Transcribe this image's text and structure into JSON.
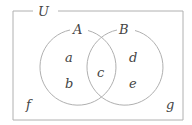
{
  "diagram": {
    "type": "venn",
    "universe_label": "U",
    "sets": [
      {
        "label": "A",
        "regions": [
          "a",
          "b",
          "c"
        ]
      },
      {
        "label": "B",
        "regions": [
          "c",
          "d",
          "e"
        ]
      }
    ],
    "regions": {
      "a": "a",
      "b": "b",
      "c": "c",
      "d": "d",
      "e": "e",
      "f": "f",
      "g": "g"
    },
    "colors": {
      "stroke": "#b0b0b0",
      "text": "#444444",
      "background": "#ffffff"
    }
  }
}
